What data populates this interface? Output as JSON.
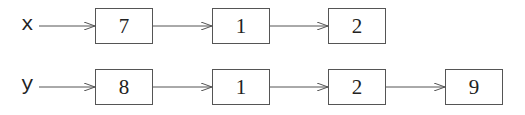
{
  "diagram": {
    "type": "linked-list",
    "lists": [
      {
        "name": "x",
        "nodes": [
          {
            "value": "7"
          },
          {
            "value": "1"
          },
          {
            "value": "2"
          }
        ]
      },
      {
        "name": "y",
        "nodes": [
          {
            "value": "8"
          },
          {
            "value": "1"
          },
          {
            "value": "2"
          },
          {
            "value": "9"
          }
        ]
      }
    ],
    "colors": {
      "stroke": "#555555",
      "text": "#222222",
      "background": "#ffffff"
    }
  }
}
